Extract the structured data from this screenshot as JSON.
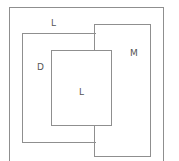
{
  "diagram": {
    "regions": [
      {
        "id": "outer",
        "label": "L"
      },
      {
        "id": "left",
        "label": "D"
      },
      {
        "id": "right",
        "label": "M"
      },
      {
        "id": "inner",
        "label": "L"
      }
    ],
    "line_color": "#8f8f8f",
    "text_color": "#555555"
  }
}
